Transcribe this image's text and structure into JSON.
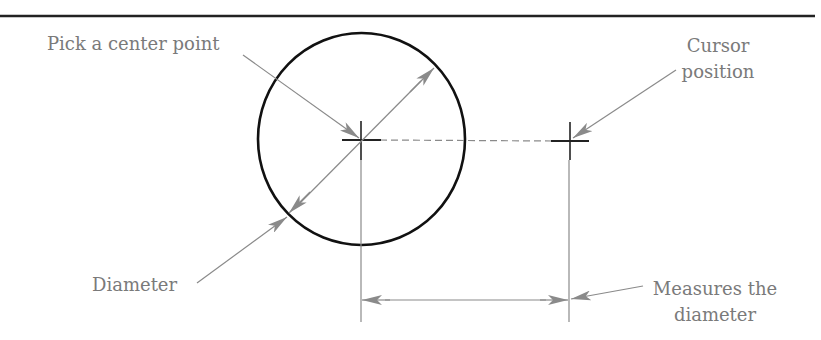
{
  "diagram": {
    "colors": {
      "ink": "#111111",
      "leader": "#8a8a8a",
      "label": "#7a7a7a",
      "dashed": "#8a8a8a"
    },
    "labels": {
      "pick_center": "Pick a center point",
      "cursor_line1": "Cursor",
      "cursor_line2": "position",
      "diameter": "Diameter",
      "measures_line1": "Measures the",
      "measures_line2": "diameter"
    },
    "geometry": {
      "circle": {
        "cx": 361,
        "cy": 139,
        "r": 105
      },
      "center_point": {
        "x": 361,
        "y": 140
      },
      "cursor_point": {
        "x": 570,
        "y": 141
      },
      "dimension_line_y": 300
    }
  }
}
